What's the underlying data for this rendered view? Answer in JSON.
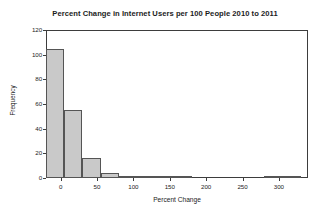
{
  "chart_data": {
    "type": "bar",
    "title": "Percent Change in Internet Users per 100 People 2010 to 2011",
    "xlabel": "Percent Change",
    "ylabel": "Frequency",
    "xlim": [
      -20,
      340
    ],
    "ylim": [
      0,
      120
    ],
    "grid": false,
    "legend": "none",
    "bin_width": 25,
    "xticks": [
      0,
      50,
      100,
      150,
      200,
      250,
      300
    ],
    "xtick_labels": [
      "0",
      "50",
      "100",
      "150",
      "200",
      "250",
      "300"
    ],
    "yticks": [
      0,
      20,
      40,
      60,
      80,
      100,
      120
    ],
    "ytick_labels": [
      "0",
      "20",
      "40",
      "60",
      "80",
      "100",
      "120"
    ],
    "bar_fill_color": "#c9c9c9",
    "bar_edge_color": "#555555",
    "axis_color": "#3d3d3d",
    "bins": [
      {
        "start": -20,
        "end": 5,
        "value": 105
      },
      {
        "start": 5,
        "end": 30,
        "value": 55
      },
      {
        "start": 30,
        "end": 55,
        "value": 16
      },
      {
        "start": 55,
        "end": 80,
        "value": 4
      },
      {
        "start": 80,
        "end": 105,
        "value": 2
      },
      {
        "start": 105,
        "end": 130,
        "value": 2
      },
      {
        "start": 130,
        "end": 155,
        "value": 1
      },
      {
        "start": 155,
        "end": 180,
        "value": 1
      },
      {
        "start": 180,
        "end": 205,
        "value": 0
      },
      {
        "start": 205,
        "end": 230,
        "value": 0
      },
      {
        "start": 230,
        "end": 255,
        "value": 0
      },
      {
        "start": 255,
        "end": 280,
        "value": 0
      },
      {
        "start": 280,
        "end": 305,
        "value": 1
      },
      {
        "start": 305,
        "end": 330,
        "value": 1
      }
    ]
  }
}
